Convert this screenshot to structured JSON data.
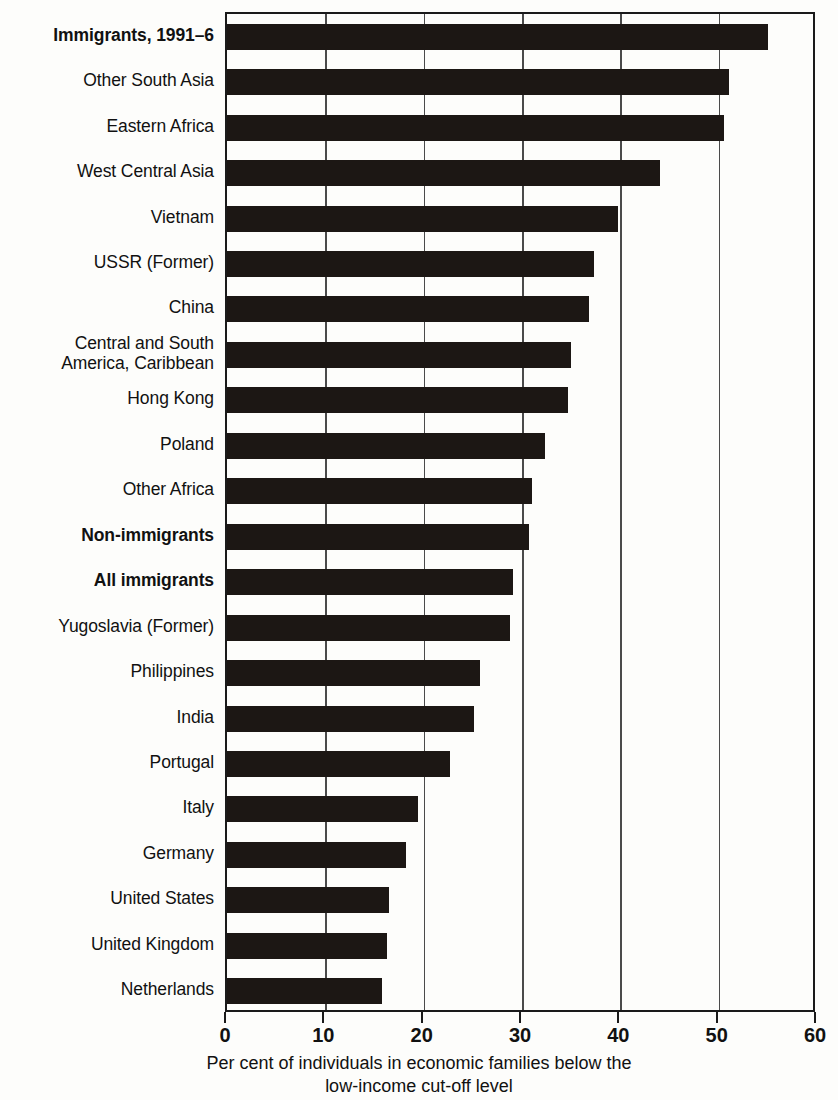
{
  "chart_data": {
    "type": "bar",
    "orientation": "horizontal",
    "title": "",
    "xlabel_line1": "Per cent of individuals in economic families below the",
    "xlabel_line2": "low-income cut-off level",
    "ylabel": "",
    "xlim": [
      0,
      60
    ],
    "xticks": [
      0,
      10,
      20,
      30,
      40,
      50,
      60
    ],
    "xticklabels": [
      "0",
      "10",
      "20",
      "30",
      "40",
      "50",
      "60"
    ],
    "grid": "vertical",
    "legend": "none",
    "bar_color": "#1c1714",
    "categories": [
      "Immigrants, 1991–6",
      "Other South Asia",
      "Eastern Africa",
      "West Central Asia",
      "Vietnam",
      "USSR (Former)",
      "China",
      "Central and South\nAmerica, Caribbean",
      "Hong Kong",
      "Poland",
      "Other Africa",
      "Non-immigrants",
      "All immigrants",
      "Yugoslavia (Former)",
      "Philippines",
      "India",
      "Portugal",
      "Italy",
      "Germany",
      "United States",
      "United Kingdom",
      "Netherlands"
    ],
    "values": [
      55.0,
      51.0,
      50.5,
      44.0,
      39.8,
      37.3,
      36.8,
      35.0,
      34.7,
      32.3,
      31.0,
      30.7,
      29.1,
      28.8,
      25.7,
      25.1,
      22.7,
      19.4,
      18.2,
      16.5,
      16.3,
      15.8
    ],
    "bold_categories": [
      "Immigrants, 1991–6",
      "Non-immigrants",
      "All immigrants"
    ]
  }
}
